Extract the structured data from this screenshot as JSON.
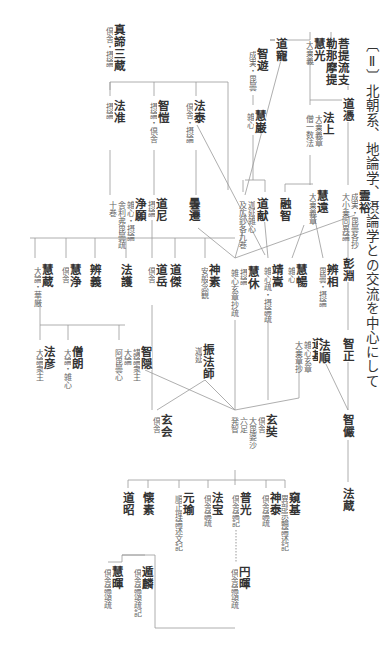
{
  "title": "〔Ⅱ〕北朝系、地論学、摂論学との交流を中心にして",
  "nodes": {
    "bodhiruci": {
      "name": "菩提流支\n勒那摩提",
      "notes": []
    },
    "eko": {
      "name": "慧光",
      "notes": [
        "大乗義"
      ]
    },
    "docho": {
      "name": "道寵",
      "notes": []
    },
    "dojo_top": {
      "name": "道憑",
      "notes": []
    },
    "hojo": {
      "name": "法上",
      "notes": [
        "大乗義章",
        "僧一数法"
      ]
    },
    "chiyu": {
      "name": "智遊",
      "notes": [
        "成実・毘曇"
      ]
    },
    "egen": {
      "name": "慧巌",
      "notes": [
        "雑心"
      ]
    },
    "paramartha": {
      "name": "真諦三蔵",
      "notes": [
        "倶舎・摂論"
      ]
    },
    "hojun": {
      "name": "法准",
      "notes": [
        "摂論"
      ]
    },
    "chigai": {
      "name": "智愷",
      "notes": [
        "摂論・倶舎"
      ]
    },
    "hotai": {
      "name": "法泰",
      "notes": [
        "倶舎・摂論"
      ]
    },
    "reiyu": {
      "name": "霊裕",
      "notes": [
        "成実・毘曇各抄",
        "大小乗同異論"
      ]
    },
    "hosen": {
      "name": "彭淵",
      "notes": []
    },
    "jogen": {
      "name": "浄願",
      "notes": [
        "雑心・摂論",
        "舎利弗毘曇疏",
        "十巻"
      ]
    },
    "doni": {
      "name": "道尼",
      "notes": [
        "摂論"
      ]
    },
    "dosen": {
      "name": "曇遷",
      "notes": []
    },
    "shinen": {
      "name": "志念",
      "notes": [
        "迦延雑心",
        "及広鈔各九巻"
      ]
    },
    "doken": {
      "name": "道献",
      "notes": []
    },
    "yuchi": {
      "name": "融智",
      "notes": []
    },
    "eon": {
      "name": "慧遠",
      "notes": [
        "大乗義章"
      ]
    },
    "eza": {
      "name": "慧蔵",
      "notes": [
        "大論・華厳"
      ]
    },
    "ejo": {
      "name": "慧浄",
      "notes": [
        "倶舎"
      ]
    },
    "bengi": {
      "name": "辨義",
      "notes": []
    },
    "hogo": {
      "name": "法護",
      "notes": []
    },
    "dogaku": {
      "name": "道岳",
      "notes": [
        "倶舎"
      ]
    },
    "doketsu": {
      "name": "道傑",
      "notes": []
    },
    "jinso": {
      "name": "神素",
      "notes": [
        "安般念観"
      ]
    },
    "ekyu": {
      "name": "慧休",
      "notes": [
        "摂論",
        "雑心玄章抄疏"
      ]
    },
    "seiso": {
      "name": "靖嵩",
      "notes": [
        "雑心疏・摂論疏"
      ]
    },
    "ekatsu": {
      "name": "慧暢",
      "notes": [
        "雑心"
      ]
    },
    "bensho": {
      "name": "辨相",
      "notes": [
        "毘曇・摂論"
      ]
    },
    "chisho": {
      "name": "智正",
      "notes": []
    },
    "hogen": {
      "name": "法彦",
      "notes": [
        "大論衆主"
      ]
    },
    "soro": {
      "name": "僧朗",
      "notes": [
        "大論・雑心"
      ]
    },
    "chion": {
      "name": "智隠",
      "notes": [
        "講論衆主",
        "大論",
        "阿毘曇心"
      ]
    },
    "shinhobu": {
      "name": "振法師",
      "notes": [
        "迦延"
      ]
    },
    "dogi": {
      "name": "道基",
      "notes": [
        "雑心玄章",
        "大乗章抄"
      ]
    },
    "hojun2": {
      "name": "法順",
      "notes": []
    },
    "chigen": {
      "name": "智儼",
      "notes": []
    },
    "genne": {
      "name": "玄会",
      "notes": [
        "倶舎"
      ]
    },
    "genjo": {
      "name": "玄奘",
      "notes": [
        "倶舎",
        "大毘婆沙",
        "六足",
        "発智"
      ]
    },
    "hozo": {
      "name": "法蔵",
      "notes": []
    },
    "dosho": {
      "name": "道昭",
      "notes": []
    },
    "eso": {
      "name": "懐素",
      "notes": []
    },
    "genyu": {
      "name": "元瑜",
      "notes": [
        "順正理論述文記"
      ]
    },
    "hoho": {
      "name": "法宝",
      "notes": [
        "倶舎論疏"
      ]
    },
    "fuko": {
      "name": "普光",
      "notes": [
        "倶舎論記"
      ]
    },
    "jintai": {
      "name": "神泰",
      "notes": [
        "倶舎論疏"
      ]
    },
    "kiki": {
      "name": "窺基",
      "notes": [
        "異部宗輪論述記"
      ]
    },
    "etaku": {
      "name": "慧暉",
      "notes": [
        "倶舎論頌疏"
      ]
    },
    "onrin": {
      "name": "遁麟",
      "notes": [
        "倶舎論頌疏記"
      ]
    },
    "enki": {
      "name": "円暉",
      "notes": [
        "倶舎論頌疏"
      ]
    }
  }
}
